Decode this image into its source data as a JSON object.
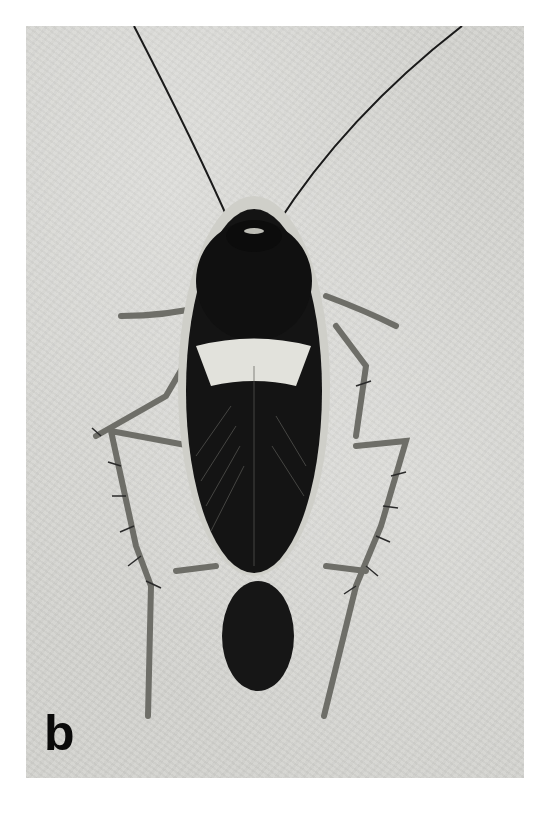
{
  "figure": {
    "panel_label": "b",
    "style": "black-and-white-photograph",
    "colors": {
      "background": "#ffffff",
      "photo_background": "#d4d4d0",
      "insect_body": "#141414",
      "pronotum_band": "#e6e6e0",
      "legs": "#7a7a74",
      "label": "#0a0a0a"
    }
  }
}
